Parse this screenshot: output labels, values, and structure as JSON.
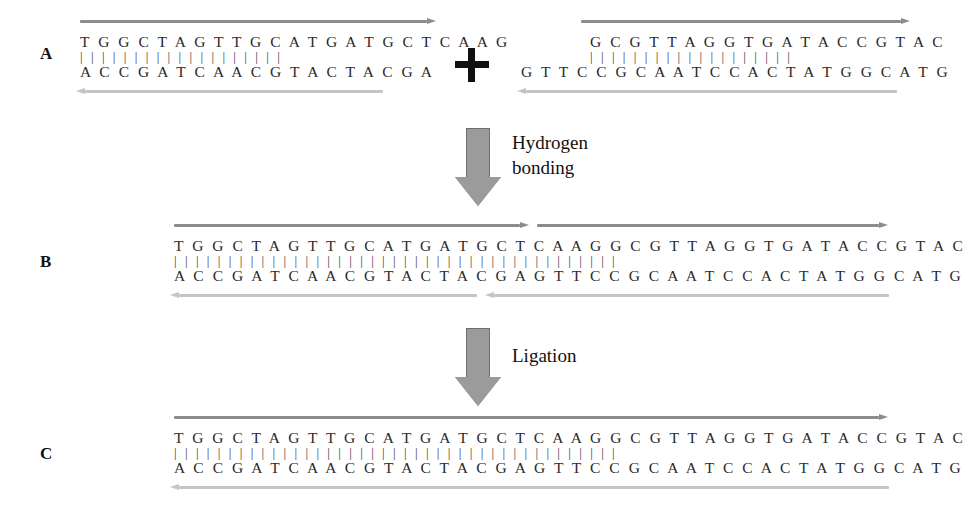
{
  "figure": {
    "background": "#ffffff",
    "colors": {
      "top_strand_arrow": "#8c8c8c",
      "bottom_strand_arrow": "#c4c4c4",
      "process_arrow_fill": "#9b9b9b",
      "process_arrow_stroke": "#6e6e6e",
      "text": "#2a2a2a",
      "plus_sign": "#111111"
    }
  },
  "panels": {
    "a": {
      "label": "A",
      "plus_sign": "+",
      "left_fragment": {
        "top_strand": "T G G C T A G T T G C A T G A T G C T C A A G",
        "hydrogen_bonds": "| | | | | | | | | | | | | | | | | | |",
        "bottom_strand": "A C C G A T C A A C G T A C T A C G A",
        "top_length": 23,
        "bottom_length": 19,
        "overhang": "CAAG",
        "overhang_end": "5' top-strand overhang at right"
      },
      "right_fragment": {
        "top_strand": "G C G T T A G G T G A T A C C G T A C",
        "hydrogen_bonds": "| | | | | | | | | | | | | | | | | | |",
        "bottom_strand": "G T T C C G C A A T C C A C T A T G G C A T G",
        "top_length": 19,
        "bottom_length": 23,
        "overhang": "GTTC",
        "overhang_end": "5' bottom-strand overhang at left"
      }
    },
    "b": {
      "label": "B",
      "top_strand": "T G G C T A G T T G C A T G A T G C T C A A G G C G T T A G G T G A T A C C G T A C",
      "hydrogen_bonds": "| | | | | | | | | | | | | | | | | | | | | | | | | | | | | | | | | | | | | | | | |",
      "bottom_strand": "A C C G A T C A A C G T A C T A C G A G T T C C G C A A T C C A C T A T G G C A T G",
      "length": 42,
      "nicks": {
        "top_strand_nick_after_base": 23,
        "bottom_strand_nick_after_base": 19
      }
    },
    "c": {
      "label": "C",
      "top_strand": "T G G C T A G T T G C A T G A T G C T C A A G G C G T T A G G T G A T A C C G T A C",
      "hydrogen_bonds": "| | | | | | | | | | | | | | | | | | | | | | | | | | | | | | | | | | | | | | | | |",
      "bottom_strand": "A C C G A T C A A C G T A C T A C G A G T T C C G C A A T C C A C T A T G G C A T G",
      "length": 42,
      "nicks": null
    }
  },
  "process_steps": [
    {
      "id": "hydrogen-bonding",
      "label": "Hydrogen\nbonding",
      "from_panel": "A",
      "to_panel": "B"
    },
    {
      "id": "ligation",
      "label": "Ligation",
      "from_panel": "B",
      "to_panel": "C"
    }
  ]
}
